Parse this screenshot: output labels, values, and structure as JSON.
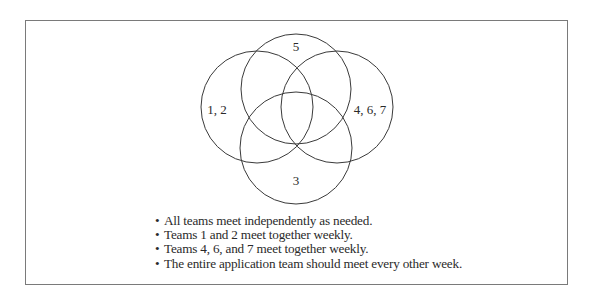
{
  "diagram": {
    "type": "venn",
    "circles": [
      {
        "id": "left",
        "label": "1, 2",
        "cx": 257,
        "cy": 107,
        "r": 56
      },
      {
        "id": "top",
        "label": "5",
        "cx": 296,
        "cy": 89,
        "r": 55
      },
      {
        "id": "right",
        "label": "4, 6, 7",
        "cx": 337,
        "cy": 107,
        "r": 56
      },
      {
        "id": "bottom",
        "label": "3",
        "cx": 296,
        "cy": 148,
        "r": 56
      }
    ],
    "labels": {
      "left": "1, 2",
      "top": "5",
      "right": "4, 6, 7",
      "bottom": "3"
    },
    "stroke_color": "#3a3a3a"
  },
  "notes": {
    "bullet": "•",
    "items": [
      "All teams meet independently as needed.",
      "Teams 1 and 2 meet together weekly.",
      "Teams 4, 6, and 7 meet together weekly.",
      "The entire application team should meet every other week."
    ]
  }
}
